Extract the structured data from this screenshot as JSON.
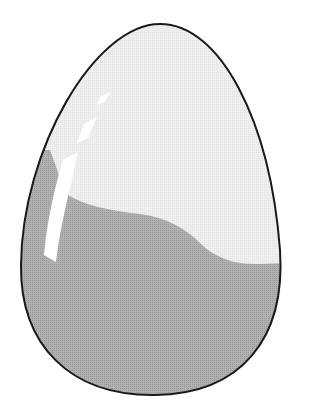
{
  "illustration": {
    "subject": "egg",
    "description": "Egg drawing with a light upper half, darker gray lower half separated by a wavy line, and a white glossy highlight on the left",
    "colors": {
      "background": "#ffffff",
      "shell_light": "#ececec",
      "shell_dark": "#a9a9a9",
      "outline": "#1a1a1a",
      "highlight": "#ffffff"
    }
  }
}
